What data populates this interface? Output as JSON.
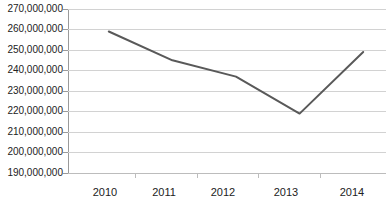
{
  "chart_data": {
    "type": "line",
    "title": "",
    "subtitle": "",
    "xlabel": "",
    "ylabel": "",
    "categories": [
      "2010",
      "2011",
      "2012",
      "2013",
      "2014"
    ],
    "series": [
      {
        "name": "",
        "values": [
          259000000,
          245000000,
          237000000,
          219000000,
          249000000
        ],
        "color": "#595959",
        "line_width": 2,
        "markers": false
      }
    ],
    "ylim": [
      190000000,
      270000000
    ],
    "ytick_step": 10000000,
    "ytick_labels": [
      "270,000,000",
      "260,000,000",
      "250,000,000",
      "240,000,000",
      "230,000,000",
      "220,000,000",
      "210,000,000",
      "200,000,000",
      "190,000,000"
    ],
    "ytick_values": [
      270000000,
      260000000,
      250000000,
      240000000,
      230000000,
      220000000,
      210000000,
      200000000,
      190000000
    ],
    "grid": {
      "horizontal": true,
      "vertical": false,
      "color": "#d2d2d2"
    },
    "legend": {
      "visible": false,
      "position": "none",
      "entries": []
    },
    "axis": {
      "y_axis_line_color": "#9a9a9a",
      "x_axis_line_color": "#bcbcbc",
      "tick_marks": true
    },
    "annotations": []
  }
}
